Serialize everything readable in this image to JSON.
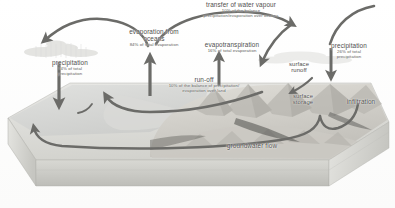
{
  "diagram": {
    "palette": {
      "arrow": "#6b6b68",
      "text": "#4a4a48",
      "subtext": "#5d5d5a",
      "block_top": "#dcdcd8",
      "block_front": "#c9c9c4",
      "block_side": "#b9b9b4",
      "ocean": "#d4d6d4",
      "land": "#cfcdc7",
      "background": "#ffffff"
    },
    "labels": [
      {
        "id": "precipitation-ocean",
        "title": "precipitation",
        "line2": "74% of total",
        "line3": "precipitation"
      },
      {
        "id": "evaporation-oceans",
        "title": "evaporation from",
        "title2": "oceans",
        "line2": "84% of total evaporation",
        "line3": ""
      },
      {
        "id": "transfer-water-vapour",
        "title": "transfer of water vapour",
        "line2": "10% of the balance",
        "line3": "precipitation/evaporation over oceans"
      },
      {
        "id": "evapotranspiration",
        "title": "evapotranspiration",
        "line2": "16% of total evaporation",
        "line3": ""
      },
      {
        "id": "precipitation-land",
        "title": "precipitation",
        "line2": "26% of total",
        "line3": "precipitation"
      },
      {
        "id": "run-off",
        "title": "run-off",
        "line2": "10% of the balance of precipitation/",
        "line3": "evaporation over land"
      },
      {
        "id": "surface-runoff",
        "title": "surface",
        "title2": "runoff",
        "line2": "",
        "line3": ""
      },
      {
        "id": "surface-storage",
        "title": "surface",
        "title2": "storage",
        "line2": "",
        "line3": ""
      },
      {
        "id": "infiltration",
        "title": "infiltration",
        "line2": "",
        "line3": ""
      },
      {
        "id": "groundwater-flow",
        "title": "groundwater flow",
        "line2": "",
        "line3": ""
      }
    ]
  }
}
